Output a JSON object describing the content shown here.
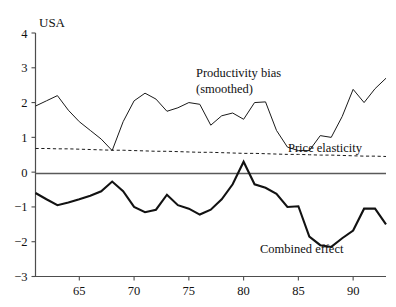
{
  "chart_data": {
    "type": "line",
    "title": "USA",
    "xlabel": "",
    "ylabel": "",
    "xlim": [
      61,
      93
    ],
    "ylim": [
      -3,
      4
    ],
    "yticks": [
      -3,
      -2,
      -1,
      0,
      1,
      2,
      3,
      4
    ],
    "ytick_labels": [
      "−3",
      "−2",
      "−1",
      "0",
      "1",
      "2",
      "3",
      "4"
    ],
    "xticks": [
      65,
      70,
      75,
      80,
      85,
      90
    ],
    "xtick_labels": [
      "65",
      "70",
      "75",
      "80",
      "85",
      "90"
    ],
    "grid": false,
    "legend_position": "inline-annotations",
    "zero_reference_line": 0,
    "x": [
      61,
      62,
      63,
      64,
      65,
      66,
      67,
      68,
      69,
      70,
      71,
      72,
      73,
      74,
      75,
      76,
      77,
      78,
      79,
      80,
      81,
      82,
      83,
      84,
      85,
      86,
      87,
      88,
      89,
      90,
      91,
      92,
      93
    ],
    "series": [
      {
        "name": "Productivity bias (smoothed)",
        "style": "thin-solid",
        "values": [
          1.9,
          2.05,
          2.2,
          1.78,
          1.45,
          1.2,
          0.95,
          0.62,
          1.45,
          2.05,
          2.27,
          2.1,
          1.75,
          1.85,
          2.0,
          1.95,
          1.35,
          1.62,
          1.7,
          1.52,
          2.0,
          2.02,
          1.2,
          0.72,
          0.62,
          0.62,
          1.05,
          1.0,
          1.6,
          2.38,
          2.0,
          2.4,
          2.7
        ]
      },
      {
        "name": "Price elasticity",
        "style": "dashed",
        "values": [
          0.68,
          0.68,
          0.67,
          0.67,
          0.66,
          0.65,
          0.64,
          0.63,
          0.63,
          0.62,
          0.61,
          0.6,
          0.6,
          0.59,
          0.58,
          0.57,
          0.57,
          0.56,
          0.55,
          0.54,
          0.54,
          0.53,
          0.52,
          0.51,
          0.51,
          0.5,
          0.49,
          0.49,
          0.48,
          0.47,
          0.46,
          0.46,
          0.45
        ]
      },
      {
        "name": "Combined effect",
        "style": "thick-solid",
        "values": [
          -0.6,
          -0.78,
          -0.95,
          -0.87,
          -0.78,
          -0.68,
          -0.55,
          -0.27,
          -0.55,
          -1.0,
          -1.15,
          -1.08,
          -0.65,
          -0.95,
          -1.05,
          -1.22,
          -1.08,
          -0.78,
          -0.35,
          0.3,
          -0.35,
          -0.45,
          -0.62,
          -1.0,
          -0.98,
          -1.85,
          -2.1,
          -2.15,
          -1.9,
          -1.68,
          -1.05,
          -1.05,
          -1.5
        ]
      }
    ],
    "annotations": [
      {
        "text": "Productivity bias",
        "x_px": 196,
        "y_px": 77
      },
      {
        "text": "(smoothed)",
        "x_px": 196,
        "y_px": 93
      },
      {
        "text": "Price elasticity",
        "x_px": 288,
        "y_px": 152
      },
      {
        "text": "Combined effect",
        "x_px": 260,
        "y_px": 253
      }
    ],
    "colors": {
      "axis": "#4d4d4d",
      "zero_line": "#595959",
      "productivity_bias": "#1a1a1a",
      "price_elasticity": "#1a1a1a",
      "combined_effect": "#121212",
      "background": "#ffffff"
    }
  }
}
